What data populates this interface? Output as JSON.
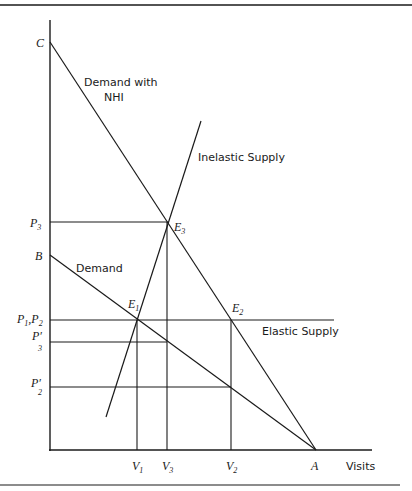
{
  "diagram": {
    "type": "economics supply-demand diagram",
    "x_axis_label": "Visits",
    "curves": {
      "demand": "Demand",
      "demand_nhi_line1": "Demand with",
      "demand_nhi_line2": "NHI",
      "inelastic_supply": "Inelastic Supply",
      "elastic_supply": "Elastic Supply"
    },
    "y_labels": {
      "C": "C",
      "B": "B",
      "P3": "P",
      "P3_sub": "3",
      "P1P2_a": "P",
      "P1P2_a_sub": "1",
      "P1P2_sep": ",",
      "P1P2_b": "P",
      "P1P2_b_sub": "2",
      "P3prime": "P′",
      "P3prime_sub": "3",
      "P2prime": "P′",
      "P2prime_sub": "2"
    },
    "x_labels": {
      "V1": "V",
      "V1_sub": "1",
      "V3": "V",
      "V3_sub": "3",
      "V2": "V",
      "V2_sub": "2",
      "A": "A"
    },
    "points": {
      "E1": "E",
      "E1_sub": "1",
      "E2": "E",
      "E2_sub": "2",
      "E3": "E",
      "E3_sub": "3"
    }
  }
}
